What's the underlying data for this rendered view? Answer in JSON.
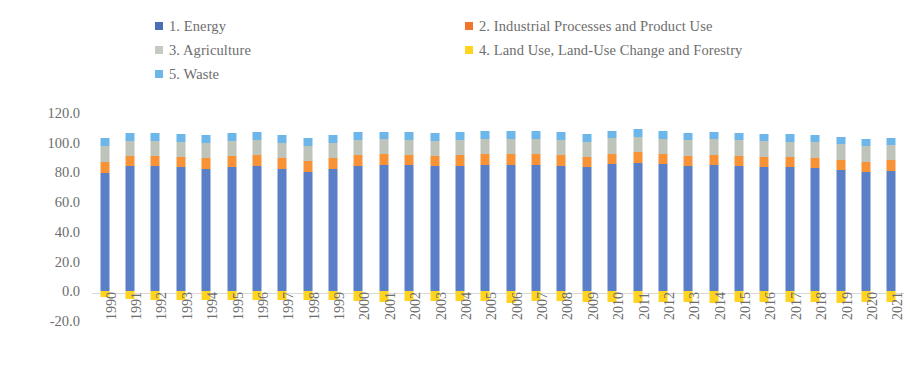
{
  "chart_data": {
    "type": "bar",
    "stacked": true,
    "title": "",
    "subtitle": "",
    "xlabel": "",
    "ylabel": "",
    "ylim": [
      -20.0,
      120.0
    ],
    "yticks": [
      "120.0",
      "100.0",
      "80.0",
      "60.0",
      "40.0",
      "20.0",
      "0.0",
      "-20.0"
    ],
    "grid": false,
    "legend_position": "top",
    "categories": [
      "1990",
      "1991",
      "1992",
      "1993",
      "1994",
      "1995",
      "1996",
      "1997",
      "1998",
      "1999",
      "2000",
      "2001",
      "2002",
      "2003",
      "2004",
      "2005",
      "2006",
      "2007",
      "2008",
      "2009",
      "2010",
      "2011",
      "2012",
      "2013",
      "2014",
      "2015",
      "2016",
      "2017",
      "2018",
      "2019",
      "2020",
      "2021"
    ],
    "series": [
      {
        "name": "1.  Energy",
        "color": "#5B7FC7",
        "values": [
          79.8,
          84.0,
          84.2,
          83.5,
          82.3,
          83.6,
          84.4,
          82.5,
          80.2,
          82.2,
          84.6,
          85.3,
          84.8,
          84.0,
          84.2,
          85.3,
          85.1,
          84.8,
          84.6,
          83.8,
          85.7,
          86.4,
          85.4,
          84.3,
          84.8,
          84.1,
          83.5,
          83.3,
          82.8,
          81.6,
          80.5,
          81.2
        ]
      },
      {
        "name": "2.  Industrial Processes and Product Use",
        "color": "#F79236",
        "values": [
          7.3,
          7.0,
          6.9,
          7.0,
          7.3,
          7.3,
          7.2,
          7.4,
          7.6,
          7.3,
          7.0,
          6.9,
          7.0,
          7.1,
          7.2,
          7.1,
          7.2,
          7.3,
          7.1,
          6.7,
          6.9,
          7.0,
          7.0,
          7.0,
          7.1,
          7.0,
          7.0,
          7.0,
          7.0,
          6.9,
          6.7,
          6.9
        ]
      },
      {
        "name": "3.  Agriculture",
        "color": "#BFC4BA",
        "values": [
          10.6,
          10.4,
          10.3,
          10.2,
          10.3,
          10.2,
          10.1,
          10.2,
          10.3,
          10.2,
          10.1,
          10.0,
          10.1,
          10.2,
          10.2,
          10.1,
          10.2,
          10.3,
          10.3,
          10.3,
          10.4,
          10.4,
          10.3,
          10.4,
          10.5,
          10.5,
          10.4,
          10.4,
          10.4,
          10.4,
          10.4,
          10.3
        ]
      },
      {
        "name": "5.  Waste",
        "color": "#6CB6EA",
        "values": [
          5.3,
          5.4,
          5.4,
          5.4,
          5.4,
          5.4,
          5.4,
          5.4,
          5.4,
          5.4,
          5.3,
          5.3,
          5.3,
          5.3,
          5.3,
          5.2,
          5.2,
          5.2,
          5.2,
          5.2,
          5.1,
          5.1,
          5.1,
          5.0,
          5.0,
          5.0,
          4.9,
          4.9,
          4.9,
          4.8,
          4.8,
          4.8
        ]
      },
      {
        "name": "4.  Land Use, Land-Use Change and Forestry",
        "color": "#FFD41F",
        "values": [
          -4.1,
          -5.3,
          -5.6,
          -5.7,
          -5.8,
          -5.8,
          -5.8,
          -5.9,
          -6.0,
          -6.0,
          -6.3,
          -7.0,
          -6.7,
          -6.4,
          -6.4,
          -6.6,
          -7.6,
          -6.7,
          -6.8,
          -7.2,
          -7.2,
          -8.0,
          -7.5,
          -7.3,
          -8.0,
          -7.3,
          -7.1,
          -7.2,
          -7.5,
          -7.6,
          -7.3,
          -7.3
        ]
      }
    ],
    "legend": [
      {
        "label": "1.  Energy",
        "color": "#4A6FB5",
        "row": 0,
        "col": 0
      },
      {
        "label": "2.  Industrial Processes and Product Use",
        "color": "#F0742A",
        "row": 0,
        "col": 1
      },
      {
        "label": "3.  Agriculture",
        "color": "#C5CBC0",
        "row": 1,
        "col": 0
      },
      {
        "label": "4.  Land Use, Land-Use Change and Forestry",
        "color": "#FFD41F",
        "row": 1,
        "col": 1
      },
      {
        "label": "5.  Waste",
        "color": "#6CB6EA",
        "row": 2,
        "col": 0
      }
    ]
  }
}
